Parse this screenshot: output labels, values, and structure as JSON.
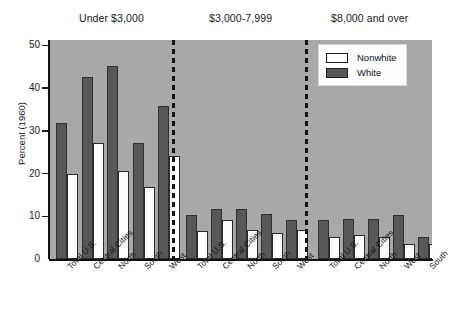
{
  "chart_data": {
    "type": "bar",
    "title": "",
    "xlabel": "",
    "ylabel": "Percent (1960)",
    "ylim": [
      0,
      50
    ],
    "yticks": [
      0,
      10,
      20,
      30,
      40,
      50
    ],
    "ytick_labels": [
      "0",
      "10",
      "20",
      "30",
      "40",
      "50"
    ],
    "grid": false,
    "legend_position": "top-right",
    "legend": [
      "Nonwhite",
      "White"
    ],
    "series_colors": {
      "Nonwhite": "#ffffff",
      "White": "#585858"
    },
    "panel_background": "#a8a8a8",
    "group_separator_style": "dashed vertical line",
    "groups": [
      {
        "header": "Under $3,000",
        "categories": [
          "Total U.S.",
          "Central Cities",
          "North",
          "South",
          "West"
        ],
        "series": [
          {
            "name": "White",
            "values": [
              31.0,
              41.5,
              44.0,
              26.5,
              35.0
            ]
          },
          {
            "name": "Nonwhite",
            "values": [
              19.5,
              26.5,
              20.0,
              16.5,
              23.5
            ]
          }
        ]
      },
      {
        "header": "$3,000-7,999",
        "categories": [
          "Total U.S.",
          "Central Cities",
          "North",
          "South",
          "West"
        ],
        "series": [
          {
            "name": "White",
            "values": [
              10.0,
              11.5,
              11.5,
              10.3,
              9.0
            ]
          },
          {
            "name": "Nonwhite",
            "values": [
              6.5,
              9.0,
              6.7,
              6.0,
              6.7
            ]
          }
        ]
      },
      {
        "header": "$8,000 and over",
        "categories": [
          "Total U.S.",
          "Central Cities",
          "North",
          "West",
          "South"
        ],
        "series": [
          {
            "name": "White",
            "values": [
              8.8,
              9.2,
              9.2,
              10.0,
              5.0
            ]
          },
          {
            "name": "Nonwhite",
            "values": [
              5.0,
              5.5,
              5.0,
              3.5,
              3.5
            ]
          }
        ]
      }
    ]
  }
}
